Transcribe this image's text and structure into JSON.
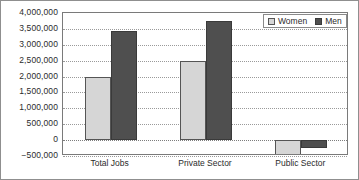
{
  "chart_data": {
    "type": "bar",
    "title": "",
    "subtitle": "",
    "xlabel": "",
    "ylabel": "",
    "categories": [
      "Total Jobs",
      "Private Sector",
      "Public Sector"
    ],
    "series": [
      {
        "name": "Women",
        "color": "#d6d6d6",
        "values": [
          2000000,
          2500000,
          -460000
        ]
      },
      {
        "name": "Men",
        "color": "#4f4f4f",
        "values": [
          3430000,
          3750000,
          -250000
        ]
      }
    ],
    "ylim": [
      -500000,
      4000000
    ],
    "ytick_values": [
      -500000,
      0,
      500000,
      1000000,
      1500000,
      2000000,
      2500000,
      3000000,
      3500000,
      4000000
    ],
    "ytick_labels": [
      "−500,000",
      "0",
      "500,000",
      "1,000,000",
      "1,500,000",
      "2,000,000",
      "2,500,000",
      "3,000,000",
      "3,500,000",
      "4,000,000"
    ],
    "grid": true,
    "grid_style": "dotted",
    "legend_position": "top-right",
    "legend_entries": [
      "Women",
      "Men"
    ]
  }
}
